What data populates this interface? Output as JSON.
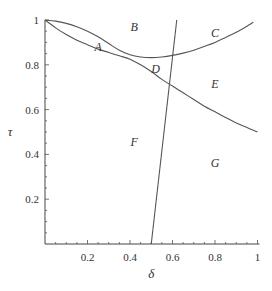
{
  "chart_data": {
    "type": "line",
    "title": "",
    "xlabel": "δ",
    "ylabel": "τ",
    "xlim": [
      0,
      1
    ],
    "ylim": [
      0,
      1
    ],
    "grid": false,
    "x_ticks": [
      {
        "value": 0.2,
        "label": "0.2"
      },
      {
        "value": 0.4,
        "label": "0.4"
      },
      {
        "value": 0.6,
        "label": "0.6"
      },
      {
        "value": 0.8,
        "label": "0.8"
      },
      {
        "value": 1.0,
        "label": "1"
      }
    ],
    "y_ticks": [
      {
        "value": 0.2,
        "label": "0.2"
      },
      {
        "value": 0.4,
        "label": "0.4"
      },
      {
        "value": 0.6,
        "label": "0.6"
      },
      {
        "value": 0.8,
        "label": "0.8"
      },
      {
        "value": 1.0,
        "label": "1"
      }
    ],
    "series": [
      {
        "name": "upper-curve",
        "x": [
          0,
          0.05,
          0.1,
          0.15,
          0.2,
          0.25,
          0.3,
          0.35,
          0.4,
          0.45,
          0.5,
          0.55,
          0.6,
          0.65,
          0.7,
          0.75,
          0.8,
          0.85,
          0.9,
          0.95,
          0.98
        ],
        "y": [
          1.0,
          0.995,
          0.985,
          0.97,
          0.95,
          0.925,
          0.895,
          0.865,
          0.845,
          0.835,
          0.832,
          0.835,
          0.842,
          0.852,
          0.865,
          0.882,
          0.9,
          0.922,
          0.945,
          0.972,
          0.99
        ]
      },
      {
        "name": "lower-curve",
        "x": [
          0,
          0.05,
          0.1,
          0.15,
          0.2,
          0.25,
          0.3,
          0.35,
          0.4,
          0.45,
          0.5,
          0.55,
          0.6,
          0.65,
          0.7,
          0.75,
          0.8,
          0.85,
          0.9,
          0.95,
          1.0
        ],
        "y": [
          1.0,
          0.965,
          0.935,
          0.91,
          0.89,
          0.87,
          0.855,
          0.84,
          0.825,
          0.8,
          0.77,
          0.735,
          0.705,
          0.675,
          0.645,
          0.615,
          0.59,
          0.565,
          0.54,
          0.52,
          0.5
        ]
      },
      {
        "name": "steep-line",
        "x": [
          0.5,
          0.62
        ],
        "y": [
          0.0,
          1.0
        ]
      }
    ],
    "annotations": [
      {
        "text": "A",
        "x": 0.25,
        "y": 0.88
      },
      {
        "text": "B",
        "x": 0.42,
        "y": 0.97
      },
      {
        "text": "C",
        "x": 0.8,
        "y": 0.94
      },
      {
        "text": "D",
        "x": 0.52,
        "y": 0.78
      },
      {
        "text": "E",
        "x": 0.8,
        "y": 0.715
      },
      {
        "text": "F",
        "x": 0.42,
        "y": 0.455
      },
      {
        "text": "G",
        "x": 0.8,
        "y": 0.36
      }
    ]
  }
}
